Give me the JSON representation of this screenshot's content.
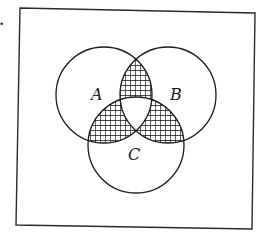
{
  "diagram": {
    "type": "venn",
    "universe": {
      "corners": [
        [
          20,
          8
        ],
        [
          255,
          13
        ],
        [
          252,
          229
        ],
        [
          16,
          225
        ]
      ],
      "stroke": "#2a2a2a"
    },
    "sets": [
      {
        "id": "A",
        "label": "A",
        "cx": 104,
        "cy": 95,
        "r": 48,
        "label_x": 97,
        "label_y": 100
      },
      {
        "id": "B",
        "label": "B",
        "cx": 168,
        "cy": 95,
        "r": 48,
        "label_x": 176,
        "label_y": 100
      },
      {
        "id": "C",
        "label": "C",
        "cx": 136,
        "cy": 145,
        "r": 48,
        "label_x": 134,
        "label_y": 160
      }
    ],
    "shaded_regions": [
      "A∩B∖C",
      "A∩C∖B",
      "B∩C∖A"
    ],
    "unshaded_regions_note": "triple intersection A∩B∩C unshaded",
    "shading": {
      "pattern": "square-grid",
      "spacing": 5,
      "color": "#111111"
    },
    "stroke_color": "#1a1a1a",
    "margin_mark": "•"
  }
}
